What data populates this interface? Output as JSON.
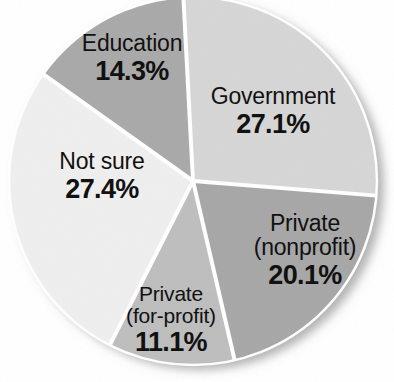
{
  "chart_data": {
    "type": "pie",
    "title": "",
    "subtitle": "",
    "xlabel": "",
    "ylabel": "",
    "legend_position": "none",
    "grid": false,
    "labels_inside_slices": true,
    "value_unit": "percent",
    "categories": [
      "Government",
      "Private (nonprofit)",
      "Private (for-profit)",
      "Not sure",
      "Education"
    ],
    "values": [
      27.1,
      20.1,
      11.1,
      27.4,
      14.3
    ],
    "value_labels": [
      "27.1%",
      "20.1%",
      "11.1%",
      "27.4%",
      "14.3%"
    ],
    "slice_colors": [
      "#d6d6d6",
      "#a7a7a7",
      "#bebebe",
      "#f0efef",
      "#a9a9a9"
    ],
    "separator_color": "#ffffff",
    "start_angle_deg": -3,
    "direction": "clockwise",
    "slices": [
      {
        "name": "Government",
        "name_lines": [
          "Government"
        ],
        "value": 27.1,
        "value_label": "27.1%",
        "color": "#d6d6d6"
      },
      {
        "name": "Private (nonprofit)",
        "name_lines": [
          "Private",
          "(nonprofit)"
        ],
        "value": 20.1,
        "value_label": "20.1%",
        "color": "#a7a7a7"
      },
      {
        "name": "Private (for-profit)",
        "name_lines": [
          "Private",
          "(for-profit)"
        ],
        "value": 11.1,
        "value_label": "11.1%",
        "color": "#bebebe"
      },
      {
        "name": "Not sure",
        "name_lines": [
          "Not sure"
        ],
        "value": 27.4,
        "value_label": "27.4%",
        "color": "#f0efef"
      },
      {
        "name": "Education",
        "name_lines": [
          "Education"
        ],
        "value": 14.3,
        "value_label": "14.3%",
        "color": "#a9a9a9"
      }
    ]
  },
  "labels": {
    "government": {
      "name": "Government",
      "value": "27.1%"
    },
    "nonprofit": {
      "name_line1": "Private",
      "name_line2": "(nonprofit)",
      "value": "20.1%"
    },
    "forprofit": {
      "name_line1": "Private",
      "name_line2": "(for-profit)",
      "value": "11.1%"
    },
    "notsure": {
      "name": "Not sure",
      "value": "27.4%"
    },
    "education": {
      "name": "Education",
      "value": "14.3%"
    }
  }
}
